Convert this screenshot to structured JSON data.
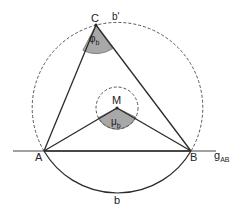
{
  "figure": {
    "type": "geometry-diagram",
    "points": {
      "A": {
        "label": "A",
        "x": 44,
        "y": 151
      },
      "B": {
        "label": "B",
        "x": 191,
        "y": 151
      },
      "C": {
        "label": "C",
        "x": 96,
        "y": 25
      },
      "M": {
        "label": "M",
        "x": 117,
        "y": 108
      }
    },
    "line": {
      "label": "g",
      "label_sub": "AB"
    },
    "arcs": {
      "lower": {
        "label": "b"
      },
      "upper": {
        "label": "b'"
      }
    },
    "angles": {
      "inscribed": {
        "label": "φ",
        "label_sub": "b",
        "vertex": "C"
      },
      "central": {
        "label": "μ",
        "label_sub": "b",
        "vertex": "M"
      }
    },
    "colors": {
      "stroke": "#2a2a2a",
      "dashed": "#555555",
      "angle_fill": "#a8a8a8"
    }
  }
}
